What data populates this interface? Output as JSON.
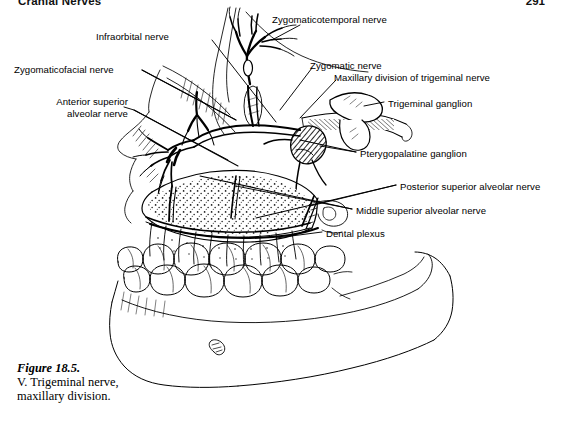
{
  "page": {
    "running_head": "Cranial Nerves",
    "folio": "291",
    "background_color": "#ffffff",
    "ink_color": "#000000"
  },
  "figure": {
    "number": "Figure 18.5.",
    "caption_text": "V. Trigeminal nerve, maxillary division."
  },
  "labels": [
    {
      "id": "infraorbital-nerve",
      "text": "Infraorbital nerve",
      "x": 96,
      "y": 31,
      "align": "left"
    },
    {
      "id": "zygomaticotemporal-nerve",
      "text": "Zygomaticotemporal nerve",
      "x": 272,
      "y": 14,
      "align": "left"
    },
    {
      "id": "zygomaticofacial-nerve",
      "text": "Zygomaticofacial nerve",
      "x": 14,
      "y": 64,
      "align": "left"
    },
    {
      "id": "zygomatic-nerve",
      "text": "Zygomatic nerve",
      "x": 310,
      "y": 60,
      "align": "left"
    },
    {
      "id": "maxillary-division",
      "text": "Maxillary division of trigeminal nerve",
      "x": 334,
      "y": 72,
      "align": "left"
    },
    {
      "id": "anterior-superior-alveolar",
      "text": "Anterior superior\nalveolar nerve",
      "x": 24,
      "y": 96,
      "align": "left"
    },
    {
      "id": "trigeminal-ganglion",
      "text": "Trigeminal ganglion",
      "x": 388,
      "y": 98,
      "align": "left"
    },
    {
      "id": "pterygopalatine-ganglion",
      "text": "Pterygopalatine ganglion",
      "x": 360,
      "y": 148,
      "align": "left"
    },
    {
      "id": "posterior-superior-alveolar",
      "text": "Posterior superior alveolar nerve",
      "x": 400,
      "y": 181,
      "align": "left"
    },
    {
      "id": "middle-superior-alveolar",
      "text": "Middle superior alveolar nerve",
      "x": 356,
      "y": 205,
      "align": "left"
    },
    {
      "id": "dental-plexus",
      "text": "Dental plexus",
      "x": 326,
      "y": 228,
      "align": "left"
    }
  ],
  "anatomy_structures": [
    "frontal and nasal bone profile",
    "orbital floor",
    "maxillary sinus with stippled lining",
    "upper dental arch",
    "lower dental arch",
    "body of mandible",
    "ramus of mandible",
    "mental foramen",
    "zygomatic arch",
    "trigeminal ganglion",
    "pterygopalatine ganglion",
    "infraorbital nerve branches",
    "superior alveolar nerve branches",
    "dental plexus"
  ]
}
